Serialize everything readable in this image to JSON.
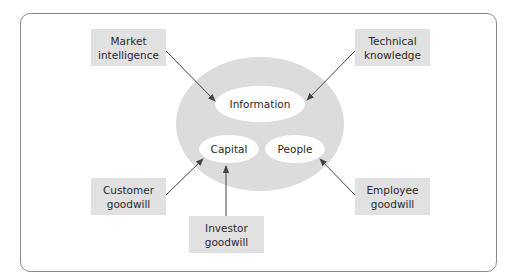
{
  "diagram": {
    "type": "concept-map",
    "frame": {
      "border_color": "#8a8a8a"
    },
    "core": {
      "fill": "#dcdcdc",
      "nodes": [
        {
          "id": "information",
          "label": "Information"
        },
        {
          "id": "capital",
          "label": "Capital"
        },
        {
          "id": "people",
          "label": "People"
        }
      ]
    },
    "sources": [
      {
        "id": "market",
        "line1": "Market",
        "line2": "intelligence",
        "target": "Information"
      },
      {
        "id": "technical",
        "line1": "Technical",
        "line2": "knowledge",
        "target": "Information"
      },
      {
        "id": "customer",
        "line1": "Customer",
        "line2": "goodwill",
        "target": "Capital"
      },
      {
        "id": "investor",
        "line1": "Investor",
        "line2": "goodwill",
        "target": "Capital"
      },
      {
        "id": "employee",
        "line1": "Employee",
        "line2": "goodwill",
        "target": "People"
      }
    ],
    "box_fill": "#e1e1e1",
    "arrow_color": "#444444"
  }
}
